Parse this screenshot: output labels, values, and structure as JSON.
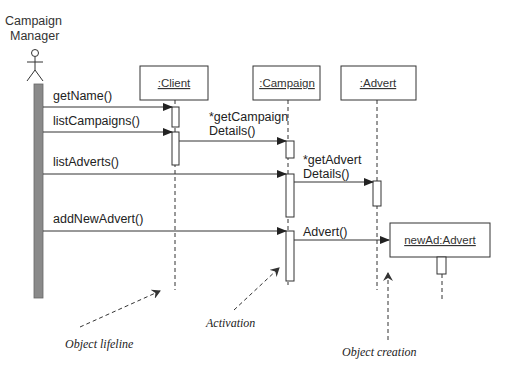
{
  "diagram": {
    "type": "UML sequence diagram",
    "actor": {
      "label_line1": "Campaign",
      "label_line2": "Manager"
    },
    "objects": [
      {
        "label": ":Client"
      },
      {
        "label": ":Campaign"
      },
      {
        "label": ":Advert"
      },
      {
        "label": "newAd:Advert"
      }
    ],
    "messages": [
      {
        "label": "getName()",
        "from": "Campaign Manager",
        "to": ":Client"
      },
      {
        "label": "listCampaigns()",
        "from": "Campaign Manager",
        "to": ":Client"
      },
      {
        "label_line1": "*getCampaign",
        "label_line2": "Details()",
        "from": ":Client",
        "to": ":Campaign"
      },
      {
        "label": "listAdverts()",
        "from": "Campaign Manager",
        "to": ":Campaign"
      },
      {
        "label_line1": "*getAdvert",
        "label_line2": "Details()",
        "from": ":Campaign",
        "to": ":Advert"
      },
      {
        "label": "addNewAdvert()",
        "from": "Campaign Manager",
        "to": ":Campaign"
      },
      {
        "label": "Advert()",
        "from": ":Campaign",
        "to": "newAd:Advert"
      }
    ],
    "annotations": [
      {
        "label": "Object lifeline"
      },
      {
        "label": "Activation"
      },
      {
        "label": "Object creation"
      }
    ],
    "colors": {
      "line": "#333333",
      "actor_bar": "#8a8a8a",
      "background": "#ffffff"
    }
  }
}
